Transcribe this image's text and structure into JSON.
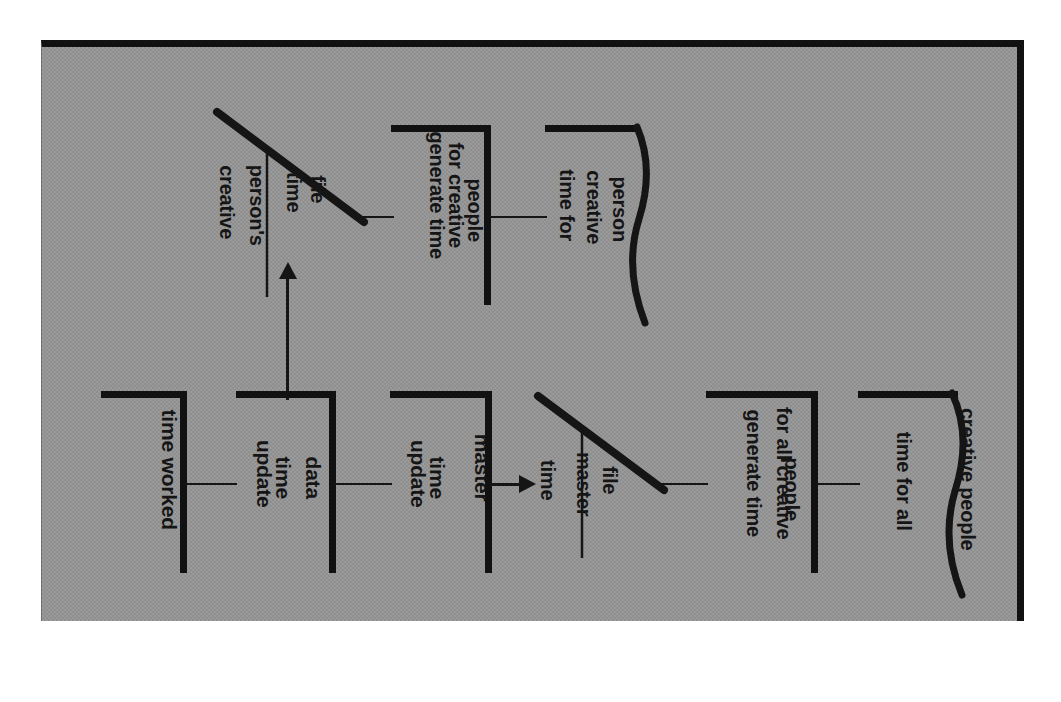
{
  "diagram": {
    "orientation": "rotated-90",
    "background_color": "#9a9a9a",
    "ink_color": "#151515",
    "nodes": [
      {
        "id": "time-worked",
        "type": "process",
        "label": "time worked",
        "lines": [
          "time worked"
        ]
      },
      {
        "id": "update-time-data",
        "type": "process",
        "label": "update time data",
        "lines": [
          "update",
          "time",
          "data"
        ]
      },
      {
        "id": "update-time-master",
        "type": "process",
        "label": "update time master",
        "lines": [
          "update",
          "time",
          "master"
        ]
      },
      {
        "id": "creative-persons-time-file",
        "type": "data-store",
        "label": "creative person's time file",
        "lines_left": [
          "creative",
          "person's"
        ],
        "lines_right": [
          "time",
          "file"
        ]
      },
      {
        "id": "time-master-file",
        "type": "data-store",
        "label": "time master file",
        "lines_left": [
          "time",
          "master"
        ],
        "lines_right": [
          "file"
        ]
      },
      {
        "id": "generate-time-creative-people",
        "type": "process",
        "label": "generate time for creative people",
        "lines": [
          "generate time",
          "for creative",
          "people"
        ]
      },
      {
        "id": "generate-time-all-creative-people",
        "type": "process",
        "label": "generate time for all creative people",
        "lines": [
          "generate time",
          "for all creative",
          "people"
        ]
      },
      {
        "id": "time-for-creative-person",
        "type": "document",
        "label": "time for creative person",
        "lines": [
          "time for",
          "creative",
          "person"
        ]
      },
      {
        "id": "time-for-all-creative-people",
        "type": "document",
        "label": "time for all creative people",
        "lines": [
          "time for all",
          "creative people"
        ]
      }
    ],
    "edges": [
      {
        "from": "time-worked",
        "to": "update-time-data",
        "arrow": false
      },
      {
        "from": "update-time-data",
        "to": "update-time-master",
        "arrow": false
      },
      {
        "from": "update-time-data",
        "to": "creative-persons-time-file",
        "arrow": true,
        "direction": "up"
      },
      {
        "from": "creative-persons-time-file",
        "to": "generate-time-creative-people",
        "arrow": false
      },
      {
        "from": "generate-time-creative-people",
        "to": "time-for-creative-person",
        "arrow": false
      },
      {
        "from": "update-time-master",
        "to": "time-master-file",
        "arrow": true,
        "direction": "right"
      },
      {
        "from": "time-master-file",
        "to": "generate-time-all-creative-people",
        "arrow": false
      },
      {
        "from": "generate-time-all-creative-people",
        "to": "time-for-all-creative-people",
        "arrow": false
      }
    ]
  }
}
